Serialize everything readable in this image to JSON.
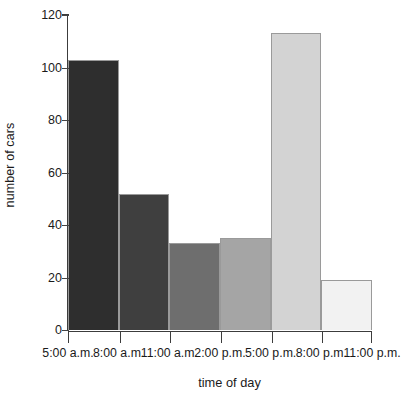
{
  "chart_data": {
    "type": "bar",
    "title": "",
    "xlabel": "time of day",
    "ylabel": "number of cars",
    "categories": [
      "5:00 a.m. - 8:00 a.m.",
      "8:00 a.m. - 11:00 a.m.",
      "11:00 a.m. - 2:00 p.m.",
      "2:00 p.m. - 5:00 p.m.",
      "5:00 p.m. - 8:00 p.m.",
      "8:00 p.m. - 11:00 p.m."
    ],
    "values": [
      103,
      52,
      33,
      35,
      113,
      19
    ],
    "bar_colors": [
      "#2e2e2e",
      "#3f3f3f",
      "#6e6e6e",
      "#a5a5a5",
      "#d3d3d3",
      "#f2f2f2"
    ],
    "xtick_labels": [
      "5:00 a.m.",
      "8:00 a.m.",
      "11:00 a.m.",
      "2:00 p.m.",
      "5:00 p.m.",
      "8:00 p.m.",
      "11:00 p.m."
    ],
    "ytick_labels": [
      "0",
      "20",
      "40",
      "60",
      "80",
      "100",
      "120"
    ],
    "ytick_values": [
      0,
      20,
      40,
      60,
      80,
      100,
      120
    ],
    "ylim": [
      0,
      120
    ],
    "grid": false,
    "legend": "none"
  }
}
